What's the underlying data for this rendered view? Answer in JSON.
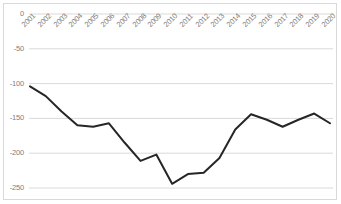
{
  "chart_data": {
    "type": "line",
    "title": "",
    "subtitle": "",
    "xlabel": "",
    "ylabel": "",
    "categories": [
      "2001",
      "2002",
      "2003",
      "2004",
      "2005",
      "2006",
      "2007",
      "2008",
      "2009",
      "2010",
      "2011",
      "2012",
      "2013",
      "2014",
      "2015",
      "2016",
      "2017",
      "2018",
      "2019",
      "2020"
    ],
    "values": [
      -104,
      -118,
      -140,
      -160,
      -162,
      -157,
      -185,
      -211,
      -202,
      -244,
      -230,
      -228,
      -207,
      -166,
      -144,
      -152,
      -162,
      -152,
      -143,
      -157
    ],
    "series": [
      {
        "name": "",
        "values": [
          -104,
          -118,
          -140,
          -160,
          -162,
          -157,
          -185,
          -211,
          -202,
          -244,
          -230,
          -228,
          -207,
          -166,
          -144,
          -152,
          -162,
          -152,
          -143,
          -157
        ]
      }
    ],
    "ylim": [
      -250,
      0
    ],
    "yticks": [
      0,
      -50,
      -100,
      -150,
      -200,
      -250
    ],
    "ytick_labels": [
      "0",
      "-50",
      "-100",
      "-150",
      "-200",
      "-250"
    ],
    "xtick_labels": [
      "2001",
      "2002",
      "2003",
      "2004",
      "2005",
      "2006",
      "2007",
      "2008",
      "2009",
      "2010",
      "2011",
      "2012",
      "2013",
      "2014",
      "2015",
      "2016",
      "2017",
      "2018",
      "2019",
      "2020"
    ],
    "grid": true,
    "grid_axis": "y",
    "legend": false,
    "legend_position": "none",
    "line_color": "#262626",
    "grid_color": "#d9d9d9",
    "border_color": "#d9d9d9",
    "tick_label_color": "#808080",
    "background_color": "#ffffff",
    "annotations": []
  }
}
